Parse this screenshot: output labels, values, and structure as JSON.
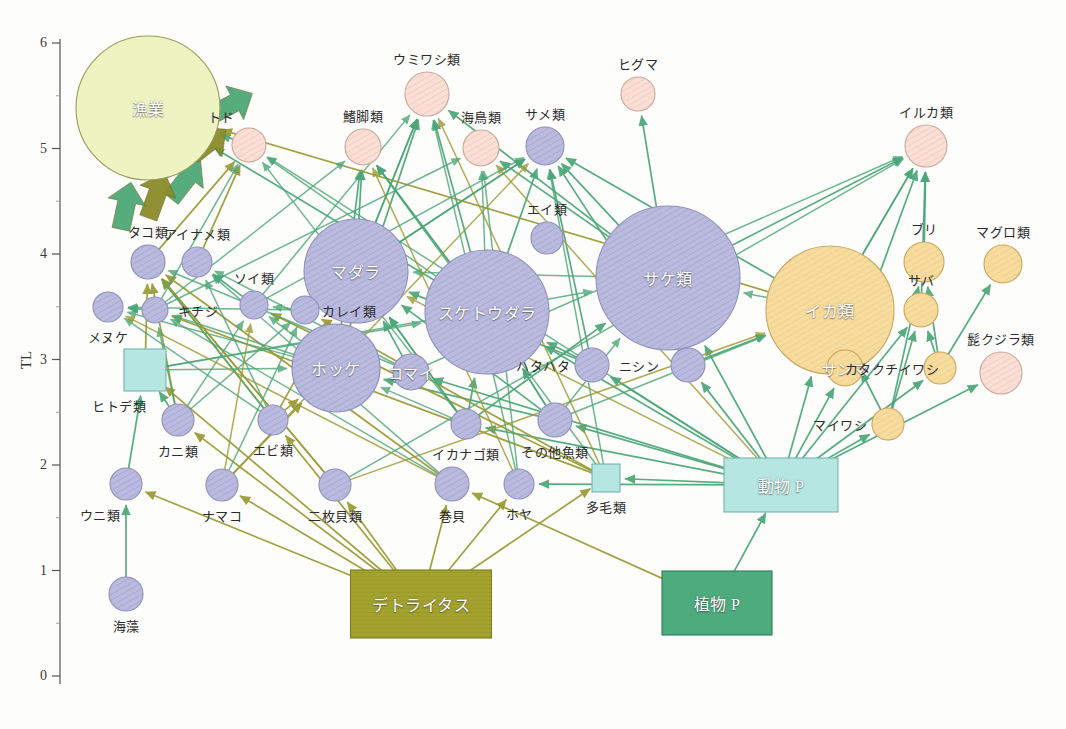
{
  "figure": {
    "type": "network-diagram",
    "axis_title": "TL",
    "y_ticks": [
      "0",
      "1",
      "2",
      "3",
      "4",
      "5",
      "6"
    ],
    "y_min": 0,
    "y_max": 6
  },
  "colors": {
    "fishery_fill": "#eef3c2",
    "mammal_fill": "#fadfd6",
    "fish_fill": "#b9bade",
    "pelagic_fill": "#f7dca0",
    "zoo_fill": "#b6e6e2",
    "detritus_fill": "#a3a22e",
    "phyto_fill": "#4dab7e",
    "arrow_green": "#4aa678",
    "arrow_olive": "#9a9a34",
    "outline": "#9a8d56"
  },
  "chart_data": {
    "type": "scatter",
    "title": "",
    "xlabel": "",
    "ylabel": "TL",
    "ylim": [
      0,
      6
    ],
    "grid": false,
    "legend": "none",
    "nodes": [
      {
        "id": "fishery",
        "label": "漁業",
        "x": 148,
        "y": 108,
        "r": 72,
        "tl": 5.5,
        "shape": "circle",
        "group": "fishery",
        "label_inside": true
      },
      {
        "id": "todo",
        "label": "トド",
        "x": 249,
        "y": 145,
        "r": 17,
        "tl": 5.08,
        "shape": "circle",
        "group": "mammal",
        "label_pos": "above-left"
      },
      {
        "id": "kikyakurui",
        "label": "鰭脚類",
        "x": 363,
        "y": 147,
        "r": 18,
        "tl": 5.06,
        "shape": "circle",
        "group": "mammal",
        "label_pos": "above"
      },
      {
        "id": "umiwashi",
        "label": "ウミワシ類",
        "x": 427,
        "y": 94,
        "r": 22,
        "tl": 5.57,
        "shape": "circle",
        "group": "mammal",
        "label_pos": "above"
      },
      {
        "id": "kaichou",
        "label": "海鳥類",
        "x": 481,
        "y": 148,
        "r": 18,
        "tl": 5.05,
        "shape": "circle",
        "group": "mammal",
        "label_pos": "above"
      },
      {
        "id": "same",
        "label": "サメ類",
        "x": 545,
        "y": 146,
        "r": 19,
        "tl": 5.07,
        "shape": "circle",
        "group": "fish",
        "label_pos": "above"
      },
      {
        "id": "higuma",
        "label": "ヒグマ",
        "x": 638,
        "y": 94,
        "r": 17,
        "tl": 5.57,
        "shape": "circle",
        "group": "mammal",
        "label_pos": "above"
      },
      {
        "id": "iruka",
        "label": "イルカ類",
        "x": 926,
        "y": 146,
        "r": 21,
        "tl": 5.07,
        "shape": "circle",
        "group": "mammal",
        "label_pos": "above"
      },
      {
        "id": "takorui",
        "label": "タコ類",
        "x": 148,
        "y": 262,
        "r": 17,
        "tl": 4.03,
        "shape": "circle",
        "group": "fish",
        "label_pos": "above"
      },
      {
        "id": "ainame",
        "label": "アイナメ類",
        "x": 197,
        "y": 262,
        "r": 15,
        "tl": 4.03,
        "shape": "circle",
        "group": "fish",
        "label_pos": "above"
      },
      {
        "id": "eirui",
        "label": "エイ類",
        "x": 547,
        "y": 238,
        "r": 16,
        "tl": 4.24,
        "shape": "circle",
        "group": "fish",
        "label_pos": "above"
      },
      {
        "id": "buri",
        "label": "ブリ",
        "x": 924,
        "y": 262,
        "r": 20,
        "tl": 4.03,
        "shape": "circle",
        "group": "pelagic",
        "label_pos": "above"
      },
      {
        "id": "maguro",
        "label": "マグロ類",
        "x": 1003,
        "y": 264,
        "r": 19,
        "tl": 4.01,
        "shape": "circle",
        "group": "pelagic",
        "label_pos": "above"
      },
      {
        "id": "madara",
        "label": "マダラ",
        "x": 356,
        "y": 271,
        "r": 52,
        "tl": 3.95,
        "shape": "circle",
        "group": "fish",
        "label_inside": true
      },
      {
        "id": "suketoudara",
        "label": "スケトウダラ",
        "x": 487,
        "y": 312,
        "r": 62,
        "tl": 3.58,
        "shape": "circle",
        "group": "fish",
        "label_inside": true
      },
      {
        "id": "sakerui",
        "label": "サケ類",
        "x": 668,
        "y": 278,
        "r": 72,
        "tl": 3.88,
        "shape": "circle",
        "group": "fish",
        "label_inside": true
      },
      {
        "id": "ikarui",
        "label": "イカ類",
        "x": 830,
        "y": 310,
        "r": 64,
        "tl": 3.6,
        "shape": "circle",
        "group": "pelagic",
        "label_inside": true
      },
      {
        "id": "soirui",
        "label": "ソイ類",
        "x": 254,
        "y": 305,
        "r": 14,
        "tl": 3.66,
        "shape": "circle",
        "group": "fish",
        "label_pos": "above"
      },
      {
        "id": "kareirui",
        "label": "カレイ類",
        "x": 305,
        "y": 310,
        "r": 14,
        "tl": 3.62,
        "shape": "circle",
        "group": "fish",
        "label_pos": "right"
      },
      {
        "id": "kichiji",
        "label": "キチジ",
        "x": 155,
        "y": 310,
        "r": 13,
        "tl": 3.62,
        "shape": "circle",
        "group": "fish",
        "label_pos": "right"
      },
      {
        "id": "menuke",
        "label": "メヌケ",
        "x": 108,
        "y": 307,
        "r": 15,
        "tl": 3.64,
        "shape": "circle",
        "group": "fish",
        "label_pos": "below"
      },
      {
        "id": "saba",
        "label": "サバ",
        "x": 921,
        "y": 310,
        "r": 17,
        "tl": 3.62,
        "shape": "circle",
        "group": "pelagic",
        "label_pos": "above"
      },
      {
        "id": "hokke",
        "label": "ホッケ",
        "x": 336,
        "y": 368,
        "r": 44,
        "tl": 3.1,
        "shape": "circle",
        "group": "fish",
        "label_inside": true
      },
      {
        "id": "komai",
        "label": "コマイ",
        "x": 411,
        "y": 372,
        "r": 18,
        "tl": 3.06,
        "shape": "circle",
        "group": "fish",
        "label_inside": true
      },
      {
        "id": "hatahata",
        "label": "ハタハタ",
        "x": 592,
        "y": 365,
        "r": 17,
        "tl": 3.12,
        "shape": "circle",
        "group": "fish",
        "label_pos": "left"
      },
      {
        "id": "nishin",
        "label": "ニシン",
        "x": 688,
        "y": 365,
        "r": 17,
        "tl": 3.12,
        "shape": "circle",
        "group": "fish",
        "label_pos": "left"
      },
      {
        "id": "sanma",
        "label": "サンマ",
        "x": 845,
        "y": 368,
        "r": 18,
        "tl": 3.09,
        "shape": "circle",
        "group": "pelagic",
        "label_inside": true
      },
      {
        "id": "katakuchi",
        "label": "カタクチイワシ",
        "x": 940,
        "y": 368,
        "r": 16,
        "tl": 3.09,
        "shape": "circle",
        "group": "pelagic",
        "label_pos": "left"
      },
      {
        "id": "higekujira",
        "label": "髭クジラ類",
        "x": 1001,
        "y": 373,
        "r": 21,
        "tl": 3.05,
        "shape": "circle",
        "group": "mammal",
        "label_pos": "above"
      },
      {
        "id": "hitode",
        "label": "ヒトデ類",
        "x": 145,
        "y": 370,
        "r": 21,
        "tl": 3.02,
        "shape": "square",
        "group": "zoo",
        "label_pos": "below-left"
      },
      {
        "id": "maiwashi",
        "label": "マイワシ",
        "x": 888,
        "y": 424,
        "r": 16,
        "tl": 2.58,
        "shape": "circle",
        "group": "pelagic",
        "label_pos": "left"
      },
      {
        "id": "ebirui",
        "label": "エビ類",
        "x": 273,
        "y": 420,
        "r": 15,
        "tl": 2.6,
        "shape": "circle",
        "group": "fish",
        "label_pos": "below"
      },
      {
        "id": "kanirui",
        "label": "カニ類",
        "x": 178,
        "y": 420,
        "r": 16,
        "tl": 2.6,
        "shape": "circle",
        "group": "fish",
        "label_pos": "below"
      },
      {
        "id": "ikanago",
        "label": "イカナゴ類",
        "x": 466,
        "y": 424,
        "r": 15,
        "tl": 2.58,
        "shape": "circle",
        "group": "fish",
        "label_pos": "below"
      },
      {
        "id": "sonota",
        "label": "その他魚類",
        "x": 555,
        "y": 420,
        "r": 17,
        "tl": 2.6,
        "shape": "circle",
        "group": "fish",
        "label_pos": "below"
      },
      {
        "id": "tamourui",
        "label": "多毛類",
        "x": 606,
        "y": 478,
        "r": 14,
        "tl": 2.08,
        "shape": "square",
        "group": "zoo",
        "label_pos": "below"
      },
      {
        "id": "unirui",
        "label": "ウニ類",
        "x": 126,
        "y": 484,
        "r": 16,
        "tl": 2.02,
        "shape": "circle",
        "group": "fish",
        "label_pos": "below-left"
      },
      {
        "id": "namako",
        "label": "ナマコ",
        "x": 222,
        "y": 485,
        "r": 16,
        "tl": 2.01,
        "shape": "circle",
        "group": "fish",
        "label_pos": "below"
      },
      {
        "id": "nimaigai",
        "label": "二枚貝類",
        "x": 335,
        "y": 485,
        "r": 16,
        "tl": 2.01,
        "shape": "circle",
        "group": "fish",
        "label_pos": "below"
      },
      {
        "id": "makigai",
        "label": "巻貝",
        "x": 452,
        "y": 484,
        "r": 17,
        "tl": 2.02,
        "shape": "circle",
        "group": "fish",
        "label_pos": "below"
      },
      {
        "id": "hoya",
        "label": "ホヤ",
        "x": 519,
        "y": 484,
        "r": 15,
        "tl": 2.02,
        "shape": "circle",
        "group": "fish",
        "label_pos": "below"
      },
      {
        "id": "kaisou",
        "label": "海藻",
        "x": 126,
        "y": 594,
        "r": 17,
        "tl": 1.0,
        "shape": "circle",
        "group": "fish",
        "label_pos": "below"
      },
      {
        "id": "doubutsuP",
        "label": "動物 P",
        "x": 781,
        "y": 485,
        "w": 114,
        "h": 54,
        "tl": 2.0,
        "shape": "rect",
        "group": "zoo",
        "label_inside": true
      },
      {
        "id": "shokubutsuP",
        "label": "植物 P",
        "x": 717,
        "y": 603,
        "w": 110,
        "h": 64,
        "tl": 1.0,
        "shape": "rect",
        "group": "phyto",
        "label_inside": true
      },
      {
        "id": "detritus",
        "label": "デトライタス",
        "x": 421,
        "y": 604,
        "w": 141,
        "h": 68,
        "tl": 1.0,
        "shape": "rect",
        "group": "detritus",
        "label_inside": true
      }
    ],
    "fishery_block_arrows": [
      {
        "from": "todo",
        "color": "green"
      },
      {
        "from": "mid-upper",
        "color": "olive"
      },
      {
        "from": "mid",
        "color": "green"
      },
      {
        "from": "lower",
        "color": "olive"
      },
      {
        "from": "lower-left",
        "color": "green"
      }
    ],
    "edges": [
      [
        "kaisou",
        "unirui",
        "green"
      ],
      [
        "unirui",
        "hitode",
        "green"
      ],
      [
        "kanirui",
        "hitode",
        "green"
      ],
      [
        "shokubutsuP",
        "doubutsuP",
        "green"
      ],
      [
        "shokubutsuP",
        "makigai",
        "olive"
      ],
      [
        "detritus",
        "makigai",
        "olive"
      ],
      [
        "detritus",
        "nimaigai",
        "olive"
      ],
      [
        "detritus",
        "namako",
        "olive"
      ],
      [
        "detritus",
        "hoya",
        "olive"
      ],
      [
        "detritus",
        "ebirui",
        "olive"
      ],
      [
        "detritus",
        "kanirui",
        "olive"
      ],
      [
        "detritus",
        "tamourui",
        "olive"
      ],
      [
        "detritus",
        "hitode",
        "olive"
      ],
      [
        "detritus",
        "unirui",
        "olive"
      ],
      [
        "doubutsuP",
        "ikanago",
        "green"
      ],
      [
        "doubutsuP",
        "nishin",
        "green"
      ],
      [
        "doubutsuP",
        "hatahata",
        "green"
      ],
      [
        "doubutsuP",
        "sonota",
        "green"
      ],
      [
        "doubutsuP",
        "maiwashi",
        "green"
      ],
      [
        "doubutsuP",
        "katakuchi",
        "green"
      ],
      [
        "doubutsuP",
        "sanma",
        "green"
      ],
      [
        "doubutsuP",
        "saba",
        "green"
      ],
      [
        "doubutsuP",
        "higekujira",
        "green"
      ],
      [
        "doubutsuP",
        "suketoudara",
        "green"
      ],
      [
        "doubutsuP",
        "sakerui",
        "green"
      ],
      [
        "doubutsuP",
        "ikarui",
        "green"
      ],
      [
        "doubutsuP",
        "hoya",
        "green"
      ],
      [
        "doubutsuP",
        "tamourui",
        "green"
      ],
      [
        "doubutsuP",
        "komai",
        "green"
      ],
      [
        "ikanago",
        "suketoudara",
        "green"
      ],
      [
        "ikanago",
        "madara",
        "green"
      ],
      [
        "ikanago",
        "sakerui",
        "green"
      ],
      [
        "nishin",
        "sakerui",
        "green"
      ],
      [
        "nishin",
        "ikarui",
        "green"
      ],
      [
        "nishin",
        "same",
        "green"
      ],
      [
        "hatahata",
        "madara",
        "green"
      ],
      [
        "hatahata",
        "suketoudara",
        "green"
      ],
      [
        "hatahata",
        "same",
        "green"
      ],
      [
        "sonota",
        "madara",
        "green"
      ],
      [
        "sonota",
        "hokke",
        "green"
      ],
      [
        "sonota",
        "suketoudara",
        "green"
      ],
      [
        "maiwashi",
        "buri",
        "green"
      ],
      [
        "maiwashi",
        "saba",
        "green"
      ],
      [
        "maiwashi",
        "ikarui",
        "green"
      ],
      [
        "katakuchi",
        "buri",
        "green"
      ],
      [
        "katakuchi",
        "maguro",
        "green"
      ],
      [
        "katakuchi",
        "saba",
        "green"
      ],
      [
        "sanma",
        "ikarui",
        "green"
      ],
      [
        "sanma",
        "iruka",
        "green"
      ],
      [
        "saba",
        "iruka",
        "green"
      ],
      [
        "buri",
        "iruka",
        "green"
      ],
      [
        "ikarui",
        "iruka",
        "green"
      ],
      [
        "ikarui",
        "same",
        "green"
      ],
      [
        "suketoudara",
        "same",
        "green"
      ],
      [
        "suketoudara",
        "kikyakurui",
        "green"
      ],
      [
        "suketoudara",
        "umiwashi",
        "green"
      ],
      [
        "madara",
        "umiwashi",
        "green"
      ],
      [
        "madara",
        "kikyakurui",
        "green"
      ],
      [
        "madara",
        "same",
        "green"
      ],
      [
        "sakerui",
        "higuma",
        "green"
      ],
      [
        "sakerui",
        "umiwashi",
        "green"
      ],
      [
        "sakerui",
        "kaichou",
        "green"
      ],
      [
        "sakerui",
        "same",
        "green"
      ],
      [
        "sakerui",
        "iruka",
        "green"
      ],
      [
        "hokke",
        "umiwashi",
        "green"
      ],
      [
        "hokke",
        "kikyakurui",
        "green"
      ],
      [
        "komai",
        "madara",
        "green"
      ],
      [
        "ebirui",
        "madara",
        "olive"
      ],
      [
        "ebirui",
        "hokke",
        "olive"
      ],
      [
        "ebirui",
        "takorui",
        "olive"
      ],
      [
        "kanirui",
        "takorui",
        "olive"
      ],
      [
        "nimaigai",
        "takorui",
        "olive"
      ],
      [
        "makigai",
        "takorui",
        "olive"
      ],
      [
        "namako",
        "hokke",
        "olive"
      ],
      [
        "tamourui",
        "kareirui",
        "olive"
      ],
      [
        "tamourui",
        "soirui",
        "olive"
      ],
      [
        "tamourui",
        "kichiji",
        "olive"
      ],
      [
        "hitode",
        "takorui",
        "olive"
      ],
      [
        "takorui",
        "todo",
        "olive"
      ],
      [
        "ainame",
        "todo",
        "olive"
      ],
      [
        "kareirui",
        "madara",
        "olive"
      ],
      [
        "soirui",
        "ainame",
        "green"
      ],
      [
        "kichiji",
        "menuke",
        "green"
      ],
      [
        "todo",
        "fishery",
        "green"
      ],
      [
        "ikarui",
        "fishery",
        "olive"
      ],
      [
        "suketoudara",
        "fishery",
        "green"
      ]
    ]
  }
}
